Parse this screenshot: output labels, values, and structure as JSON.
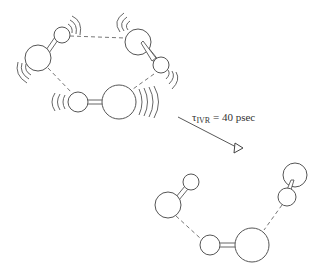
{
  "figure": {
    "top_state": "vibrationally excited hydrogen-bonded cluster",
    "bottom_state": "dissociated/relaxed cluster",
    "arrow_label": {
      "symbol": "τ",
      "subscript": "IVR",
      "text": " = 40 psec"
    },
    "colors": {
      "line": "#555555",
      "background": "#ffffff"
    }
  }
}
